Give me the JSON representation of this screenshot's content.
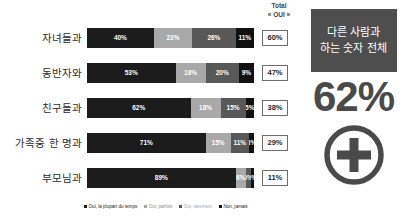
{
  "chart_data": {
    "type": "bar",
    "orientation": "horizontal",
    "stacked": true,
    "stack_mode": "percent",
    "title": "",
    "xlabel": "",
    "ylabel": "",
    "grid": false,
    "legend_position": "bottom",
    "total_column_header_line1": "Total",
    "total_column_header_line2": "« OUI »",
    "legend": [
      "Oui, la plupart du temps",
      "Oui, parfois",
      "Oui, rarement",
      "Non, jamais"
    ],
    "series": [
      {
        "name": "Oui, la plupart du temps",
        "values": [
          40,
          53,
          62,
          71,
          89
        ],
        "color": "#1c1c1c"
      },
      {
        "name": "Oui, parfois",
        "values": [
          23,
          18,
          18,
          15,
          6
        ],
        "color": "#a8a8a8"
      },
      {
        "name": "Oui, rarement",
        "values": [
          26,
          20,
          15,
          11,
          3
        ],
        "color": "#585858"
      },
      {
        "name": "Non, jamais",
        "values": [
          11,
          9,
          5,
          3,
          2
        ],
        "color": "#111111"
      }
    ],
    "categories": [
      "자녀들과",
      "동반자와",
      "친구들과",
      "가족중 한 명과",
      "부모님과"
    ],
    "totals": [
      "60%",
      "47%",
      "38%",
      "29%",
      "11%"
    ],
    "rows": [
      {
        "label": "자녀들과",
        "total": "60%",
        "segments": [
          {
            "label": "40%",
            "value": 40
          },
          {
            "label": "23%",
            "value": 23
          },
          {
            "label": "26%",
            "value": 26
          },
          {
            "label": "11%",
            "value": 11
          }
        ]
      },
      {
        "label": "동반자와",
        "total": "47%",
        "segments": [
          {
            "label": "53%",
            "value": 53
          },
          {
            "label": "18%",
            "value": 18
          },
          {
            "label": "20%",
            "value": 20
          },
          {
            "label": "9%",
            "value": 9
          }
        ]
      },
      {
        "label": "친구들과",
        "total": "38%",
        "segments": [
          {
            "label": "62%",
            "value": 62
          },
          {
            "label": "18%",
            "value": 18
          },
          {
            "label": "15%",
            "value": 15
          },
          {
            "label": "5%",
            "value": 5
          }
        ]
      },
      {
        "label": "가족중 한 명과",
        "total": "29%",
        "segments": [
          {
            "label": "71%",
            "value": 71
          },
          {
            "label": "15%",
            "value": 15
          },
          {
            "label": "11%",
            "value": 11
          },
          {
            "label": "3%",
            "value": 3
          }
        ]
      },
      {
        "label": "부모님과",
        "total": "11%",
        "segments": [
          {
            "label": "89%",
            "value": 89
          },
          {
            "label": "6%",
            "value": 6
          },
          {
            "label": "3%",
            "value": 3
          },
          {
            "label": "2%",
            "value": 2
          }
        ]
      }
    ]
  },
  "side_panel": {
    "title_line1": "다른 사람과",
    "title_line2": "하는 숫자 전체",
    "value": "62%",
    "icon": "circled-plus-icon",
    "title_bg": "#4e4e4e",
    "value_color": "#4a4a4a"
  }
}
